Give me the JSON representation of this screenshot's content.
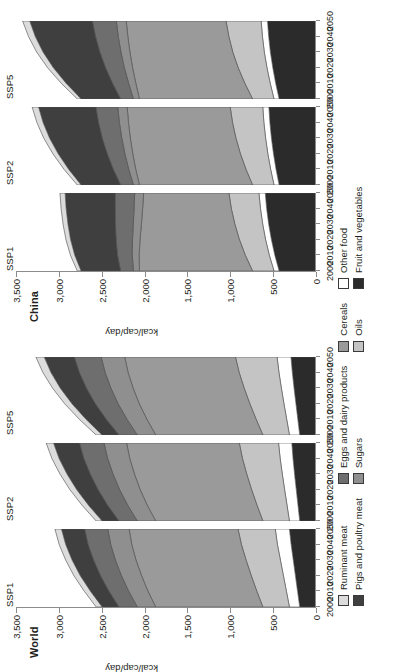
{
  "figure": {
    "y_axis_title": "kcal/cap/day",
    "y_ticks": [
      "0",
      "500",
      "1,000",
      "1,500",
      "2,000",
      "2,500",
      "3,000",
      "3,500"
    ],
    "x_ticks": [
      "2000",
      "2010",
      "2020",
      "2030",
      "2040",
      "2050"
    ]
  },
  "groups": [
    {
      "title": "World",
      "panels": [
        {
          "label": "SSP1"
        },
        {
          "label": "SSP2"
        },
        {
          "label": "SSP5"
        }
      ]
    },
    {
      "title": "China",
      "panels": [
        {
          "label": "SSP1"
        },
        {
          "label": "SSP2"
        },
        {
          "label": "SSP5"
        }
      ]
    }
  ],
  "legend": {
    "columns": [
      {
        "items": [
          {
            "label": "Ruminant meat",
            "color": "#dcdcdc"
          },
          {
            "label": "Pigs and poultry meat",
            "color": "#3f3f3f"
          }
        ]
      },
      {
        "items": [
          {
            "label": "Eggs and dairy products",
            "color": "#6e6e6e"
          },
          {
            "label": "Sugars",
            "color": "#8f8f8f"
          }
        ]
      },
      {
        "items": [
          {
            "label": "Cereals",
            "color": "#9a9a9a"
          },
          {
            "label": "Oils",
            "color": "#c4c4c4"
          }
        ]
      },
      {
        "items": [
          {
            "label": "Other food",
            "color": "#ffffff"
          },
          {
            "label": "Fruit and vegetables",
            "color": "#2b2b2b"
          }
        ]
      }
    ]
  },
  "chart_data": {
    "type": "area",
    "title": "",
    "xlabel": "",
    "ylabel": "kcal/cap/day",
    "ylim": [
      0,
      3500
    ],
    "x": [
      2000,
      2010,
      2020,
      2030,
      2040,
      2050
    ],
    "grid": false,
    "legend_position": "bottom",
    "stack_order_bottom_to_top": [
      "Fruit and vegetables",
      "Other food",
      "Oils",
      "Cereals",
      "Sugars",
      "Eggs and dairy products",
      "Pigs and poultry meat",
      "Ruminant meat"
    ],
    "panels": [
      {
        "region": "World",
        "scenario": "SSP1",
        "series": [
          {
            "name": "Fruit and vegetables",
            "color": "#2b2b2b",
            "values": [
              190,
              215,
              240,
              265,
              290,
              310
            ]
          },
          {
            "name": "Other food",
            "color": "#ffffff",
            "values": [
              120,
              130,
              140,
              150,
              160,
              165
            ]
          },
          {
            "name": "Oils",
            "color": "#c4c4c4",
            "values": [
              310,
              345,
              375,
              400,
              420,
              435
            ]
          },
          {
            "name": "Cereals",
            "color": "#9a9a9a",
            "values": [
              1250,
              1270,
              1280,
              1285,
              1280,
              1270
            ]
          },
          {
            "name": "Sugars",
            "color": "#8f8f8f",
            "values": [
              215,
              225,
              235,
              240,
              245,
              250
            ]
          },
          {
            "name": "Eggs and dairy products",
            "color": "#6e6e6e",
            "values": [
              215,
              230,
              245,
              255,
              265,
              270
            ]
          },
          {
            "name": "Pigs and poultry meat",
            "color": "#3f3f3f",
            "values": [
              195,
              215,
              235,
              250,
              260,
              270
            ]
          },
          {
            "name": "Ruminant meat",
            "color": "#dcdcdc",
            "values": [
              70,
              72,
              74,
              75,
              76,
              76
            ]
          }
        ],
        "total": [
          2565,
          2702,
          2824,
          2920,
          2996,
          3046
        ]
      },
      {
        "region": "World",
        "scenario": "SSP2",
        "series": [
          {
            "name": "Fruit and vegetables",
            "color": "#2b2b2b",
            "values": [
              190,
              210,
              230,
              250,
              268,
              282
            ]
          },
          {
            "name": "Other food",
            "color": "#ffffff",
            "values": [
              120,
              128,
              136,
              143,
              150,
              155
            ]
          },
          {
            "name": "Oils",
            "color": "#c4c4c4",
            "values": [
              310,
              350,
              385,
              415,
              440,
              458
            ]
          },
          {
            "name": "Cereals",
            "color": "#9a9a9a",
            "values": [
              1250,
              1280,
              1300,
              1310,
              1315,
              1315
            ]
          },
          {
            "name": "Sugars",
            "color": "#8f8f8f",
            "values": [
              215,
              228,
              240,
              250,
              258,
              264
            ]
          },
          {
            "name": "Eggs and dairy products",
            "color": "#6e6e6e",
            "values": [
              215,
              235,
              252,
              266,
              278,
              286
            ]
          },
          {
            "name": "Pigs and poultry meat",
            "color": "#3f3f3f",
            "values": [
              195,
              222,
              248,
              270,
              288,
              302
            ]
          },
          {
            "name": "Ruminant meat",
            "color": "#dcdcdc",
            "values": [
              70,
              75,
              79,
              82,
              84,
              86
            ]
          }
        ],
        "total": [
          2565,
          2728,
          2870,
          2986,
          3081,
          3148
        ]
      },
      {
        "region": "World",
        "scenario": "SSP5",
        "series": [
          {
            "name": "Fruit and vegetables",
            "color": "#2b2b2b",
            "values": [
              190,
              212,
              234,
              256,
              276,
              292
            ]
          },
          {
            "name": "Other food",
            "color": "#ffffff",
            "values": [
              120,
              130,
              140,
              148,
              156,
              162
            ]
          },
          {
            "name": "Oils",
            "color": "#c4c4c4",
            "values": [
              310,
              356,
              398,
              434,
              464,
              486
            ]
          },
          {
            "name": "Cereals",
            "color": "#9a9a9a",
            "values": [
              1250,
              1275,
              1290,
              1296,
              1296,
              1292
            ]
          },
          {
            "name": "Sugars",
            "color": "#8f8f8f",
            "values": [
              215,
              232,
              247,
              259,
              268,
              275
            ]
          },
          {
            "name": "Eggs and dairy products",
            "color": "#6e6e6e",
            "values": [
              215,
              242,
              266,
              286,
              302,
              314
            ]
          },
          {
            "name": "Pigs and poultry meat",
            "color": "#3f3f3f",
            "values": [
              195,
              235,
              272,
              304,
              330,
              350
            ]
          },
          {
            "name": "Ruminant meat",
            "color": "#dcdcdc",
            "values": [
              70,
              78,
              85,
              90,
              94,
              97
            ]
          }
        ],
        "total": [
          2565,
          2760,
          2932,
          3073,
          3186,
          3268
        ]
      },
      {
        "region": "China",
        "scenario": "SSP1",
        "series": [
          {
            "name": "Fruit and vegetables",
            "color": "#2b2b2b",
            "values": [
              430,
              480,
              520,
              552,
              576,
              592
            ]
          },
          {
            "name": "Other food",
            "color": "#ffffff",
            "values": [
              60,
              64,
              68,
              70,
              72,
              74
            ]
          },
          {
            "name": "Oils",
            "color": "#c4c4c4",
            "values": [
              250,
              280,
              305,
              325,
              340,
              350
            ]
          },
          {
            "name": "Cereals",
            "color": "#9a9a9a",
            "values": [
              1320,
              1240,
              1160,
              1090,
              1035,
              995
            ]
          },
          {
            "name": "Sugars",
            "color": "#8f8f8f",
            "values": [
              70,
              80,
              88,
              95,
              100,
              104
            ]
          },
          {
            "name": "Eggs and dairy products",
            "color": "#6e6e6e",
            "values": [
              150,
              172,
              192,
              208,
              220,
              228
            ]
          },
          {
            "name": "Pigs and poultry meat",
            "color": "#3f3f3f",
            "values": [
              460,
              498,
              530,
              554,
              572,
              584
            ]
          },
          {
            "name": "Ruminant meat",
            "color": "#dcdcdc",
            "values": [
              45,
              50,
              54,
              57,
              59,
              60
            ]
          }
        ],
        "total": [
          2785,
          2864,
          2917,
          2951,
          2974,
          2987
        ]
      },
      {
        "region": "China",
        "scenario": "SSP2",
        "series": [
          {
            "name": "Fruit and vegetables",
            "color": "#2b2b2b",
            "values": [
              430,
              466,
              496,
              520,
              538,
              550
            ]
          },
          {
            "name": "Other food",
            "color": "#ffffff",
            "values": [
              60,
              63,
              66,
              68,
              70,
              71
            ]
          },
          {
            "name": "Oils",
            "color": "#c4c4c4",
            "values": [
              250,
              288,
              320,
              346,
              366,
              380
            ]
          },
          {
            "name": "Cereals",
            "color": "#9a9a9a",
            "values": [
              1320,
              1286,
              1256,
              1232,
              1214,
              1202
            ]
          },
          {
            "name": "Sugars",
            "color": "#8f8f8f",
            "values": [
              70,
              82,
              92,
              100,
              106,
              110
            ]
          },
          {
            "name": "Eggs and dairy products",
            "color": "#6e6e6e",
            "values": [
              150,
              180,
              206,
              228,
              244,
              256
            ]
          },
          {
            "name": "Pigs and poultry meat",
            "color": "#3f3f3f",
            "values": [
              460,
              520,
              572,
              614,
              646,
              668
            ]
          },
          {
            "name": "Ruminant meat",
            "color": "#dcdcdc",
            "values": [
              45,
              54,
              62,
              68,
              72,
              75
            ]
          }
        ],
        "total": [
          2785,
          2939,
          3070,
          3176,
          3256,
          3312
        ]
      },
      {
        "region": "China",
        "scenario": "SSP5",
        "series": [
          {
            "name": "Fruit and vegetables",
            "color": "#2b2b2b",
            "values": [
              430,
              470,
              504,
              532,
              552,
              566
            ]
          },
          {
            "name": "Other food",
            "color": "#ffffff",
            "values": [
              60,
              64,
              68,
              71,
              73,
              74
            ]
          },
          {
            "name": "Oils",
            "color": "#c4c4c4",
            "values": [
              250,
              296,
              336,
              368,
              392,
              410
            ]
          },
          {
            "name": "Cereals",
            "color": "#9a9a9a",
            "values": [
              1320,
              1272,
              1232,
              1200,
              1178,
              1164
            ]
          },
          {
            "name": "Sugars",
            "color": "#8f8f8f",
            "values": [
              70,
              84,
              96,
              105,
              112,
              116
            ]
          },
          {
            "name": "Eggs and dairy products",
            "color": "#6e6e6e",
            "values": [
              150,
              188,
              220,
              246,
              266,
              280
            ]
          },
          {
            "name": "Pigs and poultry meat",
            "color": "#3f3f3f",
            "values": [
              460,
              540,
              608,
              662,
              702,
              730
            ]
          },
          {
            "name": "Ruminant meat",
            "color": "#dcdcdc",
            "values": [
              45,
              57,
              67,
              74,
              79,
              83
            ]
          }
        ],
        "total": [
          2785,
          2971,
          3131,
          3258,
          3354,
          3423
        ]
      }
    ]
  }
}
